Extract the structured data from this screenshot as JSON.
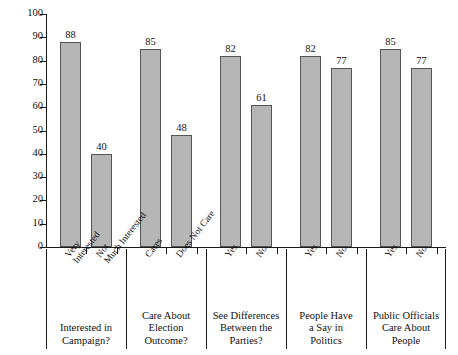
{
  "chart_data": {
    "type": "bar",
    "title": "",
    "xlabel": "",
    "ylabel": "Percent Reported Voting",
    "ylim": [
      0,
      100
    ],
    "yticks": [
      0,
      10,
      20,
      30,
      40,
      50,
      60,
      70,
      80,
      90,
      100
    ],
    "ytick_labels": [
      "0",
      "10",
      "20",
      "30",
      "40",
      "50",
      "60",
      "70",
      "80",
      "90",
      "100"
    ],
    "grid": false,
    "legend": "none",
    "value_labels": true,
    "bar_color": "#b6b6b6",
    "bar_edge_color": "#555555",
    "axis_color": "#1a1a1a",
    "groups": [
      {
        "title": "Interested in Campaign?",
        "title_lines": [
          "Interested in",
          "Campaign?"
        ],
        "categories": [
          "Very Interested",
          "Not Much Interested"
        ],
        "category_lines": [
          [
            "Very",
            "Interested"
          ],
          [
            "Not",
            "Much Interested"
          ]
        ],
        "values": [
          88,
          40
        ]
      },
      {
        "title": "Care About Election Outcome?",
        "title_lines": [
          "Care About",
          "Election",
          "Outcome?"
        ],
        "categories": [
          "Cares",
          "Does Not Care"
        ],
        "category_lines": [
          [
            "Cares",
            ""
          ],
          [
            "Does Not Care",
            ""
          ]
        ],
        "values": [
          85,
          48
        ]
      },
      {
        "title": "See Differences Between the Parties?",
        "title_lines": [
          "See Differences",
          "Between the",
          "Parties?"
        ],
        "categories": [
          "Yes",
          "No"
        ],
        "category_lines": [
          [
            "Yes",
            ""
          ],
          [
            "No",
            ""
          ]
        ],
        "values": [
          82,
          61
        ]
      },
      {
        "title": "People Have a Say in Politics",
        "title_lines": [
          "People Have",
          "a Say in",
          "Politics"
        ],
        "categories": [
          "Yes",
          "No"
        ],
        "category_lines": [
          [
            "Yes",
            ""
          ],
          [
            "No",
            ""
          ]
        ],
        "values": [
          82,
          77
        ]
      },
      {
        "title": "Public Officials Care About People",
        "title_lines": [
          "Public Officials",
          "Care About",
          "People"
        ],
        "categories": [
          "Yes",
          "No"
        ],
        "category_lines": [
          [
            "Yes",
            ""
          ],
          [
            "No",
            ""
          ]
        ],
        "values": [
          85,
          77
        ]
      }
    ],
    "categories_flat": [
      "Very Interested",
      "Not Much Interested",
      "Cares",
      "Does Not Care",
      "Yes",
      "No",
      "Yes",
      "No",
      "Yes",
      "No"
    ],
    "values_flat": [
      88,
      40,
      85,
      48,
      82,
      61,
      82,
      77,
      85,
      77
    ]
  }
}
